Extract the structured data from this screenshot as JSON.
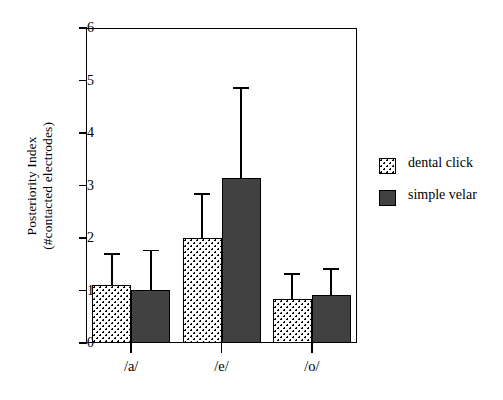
{
  "chart_data": {
    "type": "bar",
    "title": "",
    "xlabel": "",
    "ylabel": "Posteriority Index (#contacted electrodes)",
    "ylabel_line1": "Posteriority Index",
    "ylabel_line2": "(#contacted electrodes)",
    "categories": [
      "/a/",
      "/e/",
      "/o/"
    ],
    "ylim": [
      0,
      6
    ],
    "yticks": [
      "0",
      "1",
      "2",
      "3",
      "4",
      "5",
      "6"
    ],
    "grid": false,
    "legend_position": "right",
    "series": [
      {
        "name": "dental click",
        "fill": "dotted",
        "color": "#ffffff",
        "values": [
          1.1,
          2.0,
          0.84
        ],
        "errors_upper": [
          1.71,
          2.85,
          1.33
        ]
      },
      {
        "name": "simple velar",
        "fill": "solid",
        "color": "#414141",
        "values": [
          1.01,
          3.14,
          0.91
        ],
        "errors_upper": [
          1.78,
          4.88,
          1.42
        ]
      }
    ]
  },
  "legend": {
    "entries": [
      {
        "label": "dental click",
        "swatch": "dotted-swatch-icon"
      },
      {
        "label": "simple velar",
        "swatch": "solid-swatch-icon"
      }
    ]
  }
}
